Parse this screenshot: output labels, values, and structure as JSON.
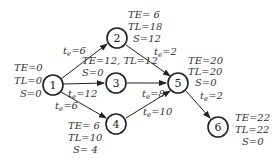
{
  "nodes": [
    {
      "id": "1",
      "label": "1",
      "cx": 53,
      "cy": 85,
      "te": "TE=0",
      "tl": "TL=0",
      "s": "S=0"
    },
    {
      "id": "2",
      "label": "2",
      "cx": 117,
      "cy": 38,
      "te": "TE= 6",
      "tl": "TL=18",
      "s": "S=12"
    },
    {
      "id": "3",
      "label": "3",
      "cx": 116,
      "cy": 83,
      "te_tl": "TE=12, TL=12",
      "s": "S=0"
    },
    {
      "id": "4",
      "label": "4",
      "cx": 116,
      "cy": 124,
      "te": "TE= 6",
      "tl": "TL=10",
      "s": "S= 4"
    },
    {
      "id": "5",
      "label": "5",
      "cx": 178,
      "cy": 83,
      "te": "TE=20",
      "tl": "TL=20",
      "s": "S=0"
    },
    {
      "id": "6",
      "label": "6",
      "cx": 218,
      "cy": 127,
      "te": "TE=22",
      "tl": "TL=22",
      "s": "S=0"
    }
  ],
  "edges": [
    {
      "from": "1",
      "to": "2",
      "label": "te=6"
    },
    {
      "from": "1",
      "to": "3",
      "label": "te=12"
    },
    {
      "from": "1",
      "to": "4",
      "label": "te=6"
    },
    {
      "from": "2",
      "to": "5",
      "label": "te=2"
    },
    {
      "from": "3",
      "to": "5",
      "label": "te=8"
    },
    {
      "from": "4",
      "to": "5",
      "label": "te=10"
    },
    {
      "from": "5",
      "to": "6",
      "label": "te=2"
    }
  ],
  "text": {
    "n1": "1",
    "n2": "2",
    "n3": "3",
    "n4": "4",
    "n5": "5",
    "n6": "6",
    "n1_te": "TE=0",
    "n1_tl": "TL=0",
    "n1_s": "S=0",
    "n2_te": "TE= 6",
    "n2_tl": "TL=18",
    "n2_s": "S=12",
    "n3_tetl": "TE=12, TL=12",
    "n3_s": "S=0",
    "n4_te": "TE= 6",
    "n4_tl": "TL=10",
    "n4_s": "S= 4",
    "n5_te": "TE=20",
    "n5_tl": "TL=20",
    "n5_s": "S=0",
    "n6_te": "TE=22",
    "n6_tl": "TL=22",
    "n6_s": "S=0",
    "e12_t": "t",
    "e12_sub": "e",
    "e12_v": "=6",
    "e13_t": "t",
    "e13_sub": "e",
    "e13_v": "=12",
    "e14_t": "t",
    "e14_sub": "e",
    "e14_v": "=6",
    "e25_t": "t",
    "e25_sub": "e",
    "e25_v": "=2",
    "e35_t": "t",
    "e35_sub": "e",
    "e35_v": "=8",
    "e45_t": "t",
    "e45_sub": "e",
    "e45_v": "=10",
    "e56_t": "t",
    "e56_sub": "e",
    "e56_v": "=2"
  },
  "colors": {
    "stroke": "#222222",
    "text": "#333333",
    "background": "#ffffff"
  }
}
